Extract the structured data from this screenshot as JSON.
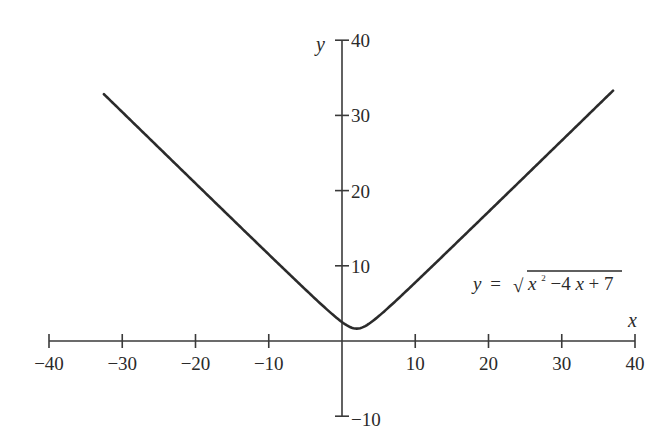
{
  "chart_data": {
    "type": "line",
    "title": "",
    "xlabel": "x",
    "ylabel": "y",
    "xlim": [
      -40,
      40
    ],
    "ylim": [
      -10,
      40
    ],
    "x_ticks": [
      -40,
      -30,
      -20,
      -10,
      10,
      20,
      30,
      40
    ],
    "x_tick_labels": [
      "−40",
      "−30",
      "−20",
      "−10",
      "10",
      "20",
      "30",
      "40"
    ],
    "y_ticks": [
      40,
      30,
      20,
      10,
      -10
    ],
    "y_tick_labels": [
      "40",
      "30",
      "20",
      "10",
      "−10"
    ],
    "grid": false,
    "legend": null,
    "series": [
      {
        "name": "y = sqrt(x^2 - 4x + 7)",
        "function": "sqrt(x^2 - 4x + 7)",
        "x_range": [
          -32.5,
          37
        ],
        "x": [
          -32.5,
          -30,
          -20,
          -10,
          -5,
          0,
          2,
          5,
          10,
          20,
          30,
          37
        ],
        "y": [
          34.6,
          32.1,
          22.2,
          12.3,
          7.5,
          2.65,
          1.73,
          3.46,
          8.43,
          18.2,
          28.1,
          35.0
        ]
      }
    ],
    "annotations": [
      {
        "text": "y = √(x² −4x + 7)",
        "position": [
          18,
          7.5
        ]
      }
    ]
  },
  "labels": {
    "x_axis": "x",
    "y_axis": "y",
    "equation": {
      "lhs": "y",
      "eq": "=",
      "radical": "√",
      "x1": "x",
      "sup": "2",
      "mid": " −4",
      "x2": "x",
      "tail": " + 7"
    }
  },
  "colors": {
    "line": "#2b2b2b",
    "axis": "#3a3a3a",
    "background": "#ffffff"
  }
}
